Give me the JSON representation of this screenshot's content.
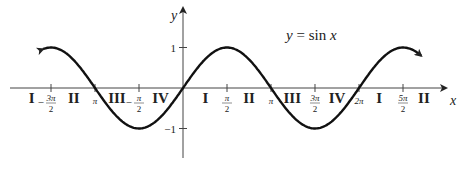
{
  "chart_data": {
    "type": "line",
    "title": "y = sin x",
    "xlabel": "x",
    "ylabel": "y",
    "function": "sin",
    "x_range": [
      -5.0,
      8.5
    ],
    "ylim": [
      -1,
      1
    ],
    "x_ticks": [
      {
        "value": -4.712,
        "label_num": "3π",
        "label_den": "2",
        "neg": true
      },
      {
        "value": -3.1416,
        "label": "π"
      },
      {
        "value": -1.5708,
        "label_num": "π",
        "label_den": "2",
        "neg": true
      },
      {
        "value": 1.5708,
        "label_num": "π",
        "label_den": "2"
      },
      {
        "value": 3.1416,
        "label": "π"
      },
      {
        "value": 4.712,
        "label_num": "3π",
        "label_den": "2"
      },
      {
        "value": 6.2832,
        "label": "2π"
      },
      {
        "value": 7.854,
        "label_num": "5π",
        "label_den": "2"
      }
    ],
    "y_ticks": [
      {
        "value": 1,
        "label": "1"
      },
      {
        "value": -1,
        "label": "−1"
      }
    ],
    "quadrant_labels": [
      {
        "x": -5.4,
        "label": "I"
      },
      {
        "x": -3.9,
        "label": "II"
      },
      {
        "x": -2.36,
        "label": "III"
      },
      {
        "x": -0.8,
        "label": "IV"
      },
      {
        "x": 0.8,
        "label": "I"
      },
      {
        "x": 2.36,
        "label": "II"
      },
      {
        "x": 3.9,
        "label": "III"
      },
      {
        "x": 5.5,
        "label": "IV"
      },
      {
        "x": 7.0,
        "label": "I"
      },
      {
        "x": 8.6,
        "label": "II"
      }
    ]
  }
}
